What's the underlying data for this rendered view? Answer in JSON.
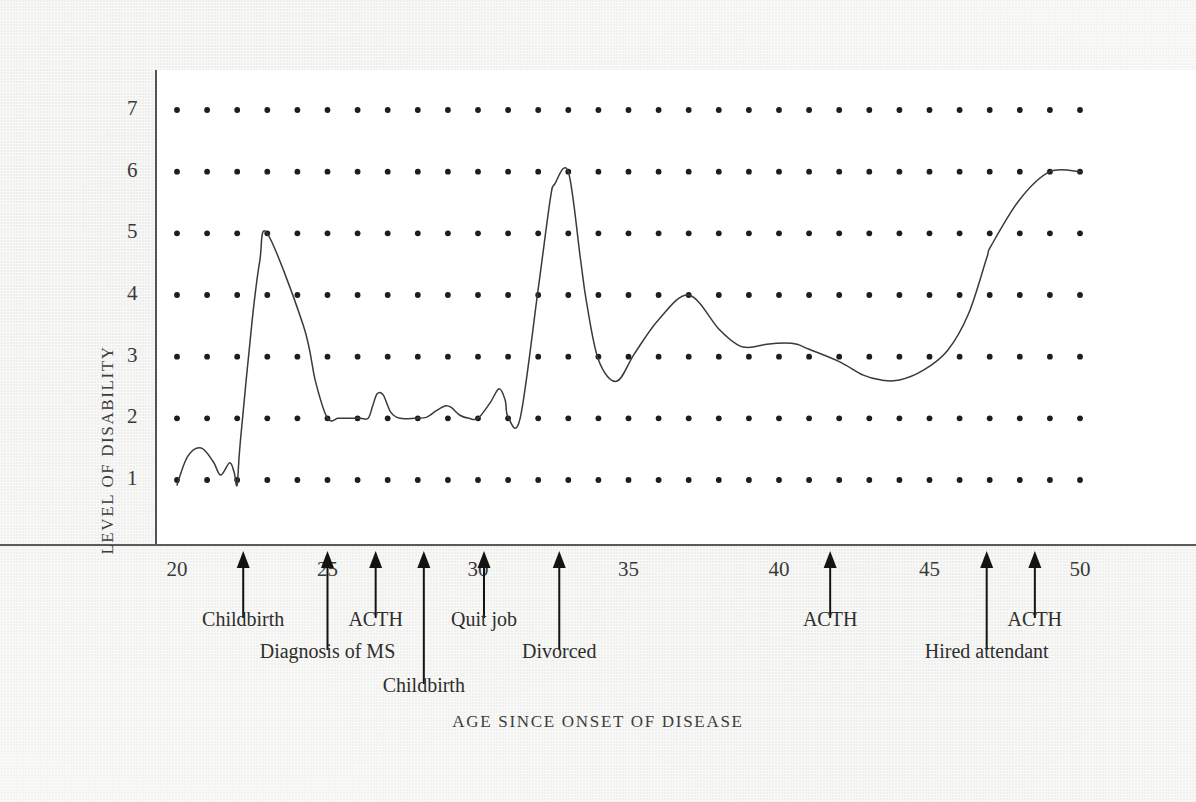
{
  "figure": {
    "y_axis_title": "LEVEL OF DISABILITY",
    "x_axis_title": "AGE SINCE ONSET OF DISEASE"
  },
  "chart_data": {
    "type": "line",
    "title": "",
    "subtitle": "",
    "xlabel": "AGE SINCE ONSET OF DISEASE",
    "ylabel": "LEVEL OF DISABILITY",
    "xlim": [
      20,
      50
    ],
    "ylim": [
      1,
      7
    ],
    "grid": "dot-matrix",
    "grid_dot_columns": 31,
    "grid_dot_rows": 7,
    "legend": "none",
    "x_ticks": [
      20,
      25,
      30,
      35,
      40,
      45,
      50
    ],
    "x_tick_labels": [
      "20",
      "25",
      "30",
      "35",
      "40",
      "45",
      "50"
    ],
    "y_ticks": [
      1,
      2,
      3,
      4,
      5,
      6,
      7
    ],
    "y_tick_labels": [
      "1",
      "2",
      "3",
      "4",
      "5",
      "6",
      "7"
    ],
    "series": [
      {
        "name": "Level of disability",
        "color": "#3a3a38",
        "x": [
          20.0,
          20.35,
          20.8,
          21.2,
          21.45,
          21.75,
          21.9,
          22.0,
          22.1,
          22.5,
          22.75,
          23.0,
          24.2,
          24.6,
          25.0,
          25.35,
          25.6,
          25.85,
          26.1,
          26.35,
          26.5,
          26.65,
          26.85,
          27.1,
          27.4,
          27.9,
          28.3,
          28.6,
          28.9,
          29.1,
          29.4,
          29.7,
          30.0,
          30.4,
          30.7,
          30.9,
          31.0,
          31.4,
          32.0,
          32.4,
          32.55,
          33.0,
          33.4,
          33.6,
          34.0,
          34.6,
          35.2,
          36.0,
          37.0,
          38.0,
          38.6,
          39.0,
          39.6,
          40.2,
          40.6,
          41.0,
          42.0,
          42.8,
          43.4,
          44.0,
          44.8,
          45.6,
          46.3,
          46.9,
          47.05,
          48.0,
          49.0,
          50.0
        ],
        "y": [
          0.92,
          1.38,
          1.52,
          1.3,
          1.08,
          1.28,
          1.12,
          0.92,
          1.6,
          3.6,
          4.55,
          5.0,
          3.5,
          2.6,
          2.0,
          2.0,
          2.0,
          2.0,
          2.0,
          2.0,
          2.2,
          2.4,
          2.38,
          2.1,
          2.0,
          2.0,
          2.02,
          2.12,
          2.2,
          2.18,
          2.05,
          2.0,
          2.0,
          2.25,
          2.48,
          2.3,
          2.02,
          2.0,
          4.1,
          5.55,
          5.8,
          6.0,
          4.6,
          3.9,
          2.95,
          2.6,
          3.05,
          3.6,
          4.0,
          3.45,
          3.2,
          3.15,
          3.2,
          3.22,
          3.2,
          3.12,
          2.92,
          2.7,
          2.62,
          2.62,
          2.78,
          3.1,
          3.7,
          4.6,
          4.8,
          5.55,
          6.0,
          6.0
        ],
        "key_events_summary": "starts near 1, spike to 5 at age 22, plateau at 2, spike to 4 near 26.5, rise to 6 at age 31, drop to 2.6 at 32.5, peak 4 at 33.6, plateau ~3.2, valley 2.6 at 38, rise to 6 at 41, plateau to 42.8, decline to 3 at 47, rise to 6 at 48 through 50"
      }
    ],
    "annotations": [
      {
        "label": "Childbirth",
        "x": 22.2,
        "tier": 1
      },
      {
        "label": "Diagnosis of MS",
        "x": 25.0,
        "tier": 2
      },
      {
        "label": "ACTH",
        "x": 26.6,
        "tier": 1
      },
      {
        "label": "Childbirth",
        "x": 28.2,
        "tier": 3
      },
      {
        "label": "Quit job",
        "x": 30.2,
        "tier": 1
      },
      {
        "label": "Divorced",
        "x": 32.7,
        "tier": 2
      },
      {
        "label": "ACTH",
        "x": 41.7,
        "tier": 1
      },
      {
        "label": "Hired attendant",
        "x": 46.9,
        "tier": 2
      },
      {
        "label": "ACTH",
        "x": 48.5,
        "tier": 1
      }
    ]
  }
}
